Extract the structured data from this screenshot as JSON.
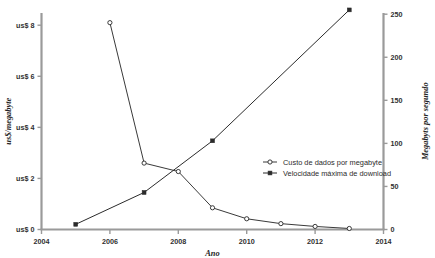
{
  "chart_data": {
    "type": "line",
    "title": "",
    "xlabel": "Ano",
    "ylabel": "us$/megabyte",
    "y2label": "Megabyts por segundo",
    "xlim": [
      2004,
      2014
    ],
    "ylim": [
      0,
      8.6
    ],
    "y2lim": [
      0,
      268
    ],
    "xticks": [
      "2004",
      "2006",
      "2008",
      "2010",
      "2012",
      "2014"
    ],
    "xtick_values": [
      2004,
      2006,
      2008,
      2010,
      2012,
      2014
    ],
    "yticks": [
      "us$ 0",
      "us$ 2",
      "us$ 4",
      "us$ 6",
      "us$ 8"
    ],
    "ytick_values": [
      0,
      2,
      4,
      6,
      8
    ],
    "y2ticks": [
      "0",
      "50",
      "100",
      "150",
      "200",
      "250"
    ],
    "y2tick_values": [
      0,
      50,
      100,
      150,
      200,
      250
    ],
    "grid": false,
    "legend_position": "center-right",
    "series": [
      {
        "name": "Custo de dados por megabyte",
        "axis": "left",
        "marker": "open-circle",
        "color": "#3a3a3a",
        "x": [
          2006,
          2007,
          2008,
          2009,
          2010,
          2011,
          2012,
          2013
        ],
        "values": [
          8.1,
          2.6,
          2.27,
          0.85,
          0.42,
          0.23,
          0.12,
          0.04
        ]
      },
      {
        "name": "Velocidade máxima de download",
        "axis": "right",
        "marker": "filled-square",
        "color": "#2b2b2b",
        "x": [
          2005,
          2007,
          2009,
          2013
        ],
        "values": [
          6,
          43,
          103,
          255
        ]
      }
    ]
  },
  "colors": {
    "axis": "#9a9a9a",
    "line": "#3a3a3a",
    "text": "#2b2b2b",
    "background": "#ffffff"
  }
}
